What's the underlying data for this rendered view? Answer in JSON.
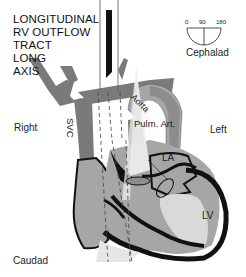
{
  "title_lines": [
    "LONGITUDINAL",
    "RV OUTFLOW",
    "TRACT",
    "LONG",
    "AXIS"
  ],
  "orientation": {
    "cephalad": "Cephalad",
    "caudad": "Caudad",
    "right": "Right",
    "left": "Left"
  },
  "angle_dial": {
    "labels": [
      "0",
      "90",
      "180"
    ],
    "indicated_angle": 90
  },
  "structures": {
    "svc": "SVC",
    "aorta": "Aorta",
    "pulm_art": "Pulm. Art.",
    "la": "LA",
    "lv": "LV"
  },
  "colors": {
    "vessel_dark": "#7a7a7a",
    "tissue_mid": "#a6a6a6",
    "chamber_light": "#d9d9d9",
    "wall_black": "#111111",
    "beam": "#eeeeee"
  }
}
